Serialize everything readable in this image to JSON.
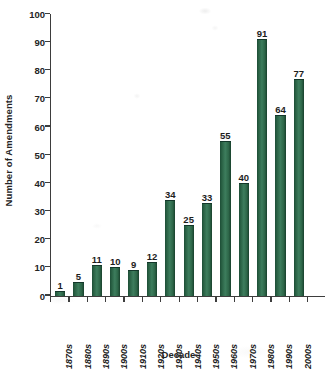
{
  "chart_data": {
    "type": "bar",
    "title": "",
    "xlabel": "Decade",
    "ylabel": "Number of Amendments",
    "categories": [
      "1870s",
      "1880s",
      "1890s",
      "1900s",
      "1910s",
      "1920s",
      "1930s",
      "1940s",
      "1950s",
      "1960s",
      "1970s",
      "1980s",
      "1990s",
      "2000s"
    ],
    "values": [
      1,
      5,
      11,
      10,
      9,
      12,
      34,
      25,
      33,
      55,
      40,
      91,
      64,
      77
    ],
    "value_labels": [
      "1",
      "5",
      "11",
      "10",
      "9",
      "12",
      "34",
      "25",
      "33",
      "55",
      "40",
      "91",
      "64",
      "77"
    ],
    "ylim": [
      0,
      100
    ],
    "ytick_step": 10,
    "yticks": [
      0,
      10,
      20,
      30,
      40,
      50,
      60,
      70,
      80,
      90,
      100
    ],
    "ytick_labels": [
      "0",
      "10",
      "20",
      "30",
      "40",
      "50",
      "60",
      "70",
      "80",
      "90",
      "100"
    ],
    "grid": false,
    "legend": null,
    "bar_color": "#2d6648",
    "axis_color": "#3d3d3d",
    "text_color": "#1d1d1d",
    "background": "#ffffff"
  }
}
